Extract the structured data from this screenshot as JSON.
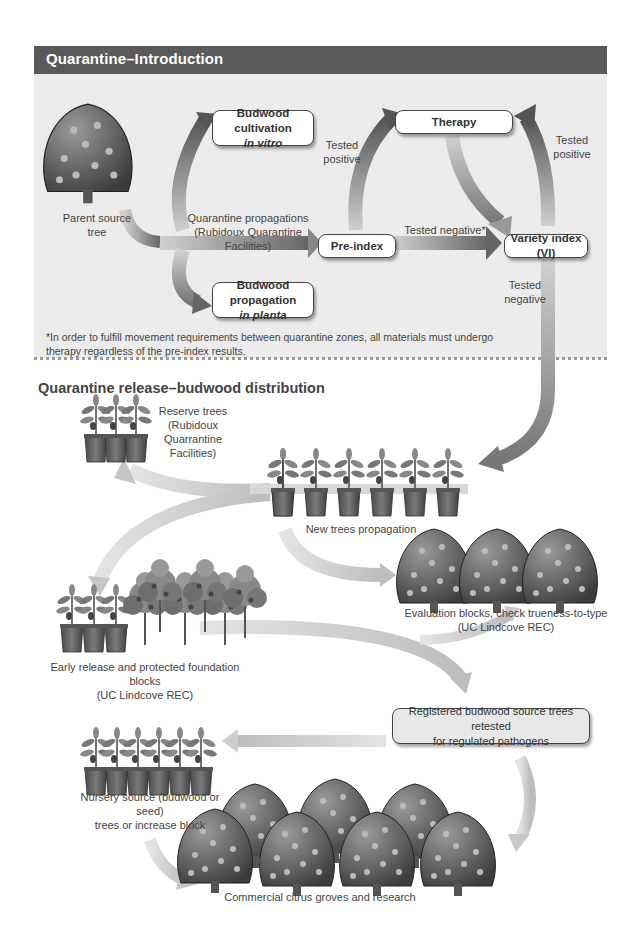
{
  "section1": {
    "title": "Quarantine–Introduction",
    "nodes": {
      "parent_tree": "Parent source tree",
      "budwood_vitro": {
        "line1": "Budwood cultivation",
        "line2": "in vitro"
      },
      "budwood_planta": {
        "line1": "Budwood propagation",
        "line2": "in planta"
      },
      "therapy": "Therapy",
      "preindex": "Pre-index",
      "variety_index": "Variety index (VI)"
    },
    "edge_labels": {
      "quarantine_prop_line1": "Quarantine propagations",
      "quarantine_prop_line2": "(Rubidoux Quarantine Facilities)",
      "tested_positive_left_1": "Tested",
      "tested_positive_left_2": "positive",
      "tested_positive_right_1": "Tested",
      "tested_positive_right_2": "positive",
      "tested_negative_star": "Tested negative*",
      "tested_negative_1": "Tested",
      "tested_negative_2": "negative"
    },
    "footnote_line1": "*In order to fulfill movement requirements between quarantine zones, all materials must undergo",
    "footnote_line2": "therapy regardless of the pre-index results."
  },
  "section2": {
    "title": "Quarantine release–budwood distribution",
    "reserve": {
      "line1": "Reserve trees",
      "line2": "(Rubidoux",
      "line3": "Quarrantine",
      "line4": "Facilities)"
    },
    "new_trees": "New trees propagation",
    "evaluation": {
      "line1": "Evaluation blocks, check trueness-to-type",
      "line2": "(UC Lindcove REC)"
    },
    "early_release": {
      "line1": "Early release and protected foundation blocks",
      "line2": "(UC Lindcove REC)"
    },
    "registered": {
      "line1": "Registered budwood source trees retested",
      "line2": "for regulated pathogens"
    },
    "nursery": {
      "line1": "Nursery source (budwood or seed)",
      "line2": "trees or increase block"
    },
    "commercial": "Commercial citrus groves and research"
  },
  "colors": {
    "header_bar": "#595959",
    "panel_bg": "#ececec",
    "arrow_light": "#c8c8c8",
    "arrow_dark": "#5a5a5a"
  }
}
